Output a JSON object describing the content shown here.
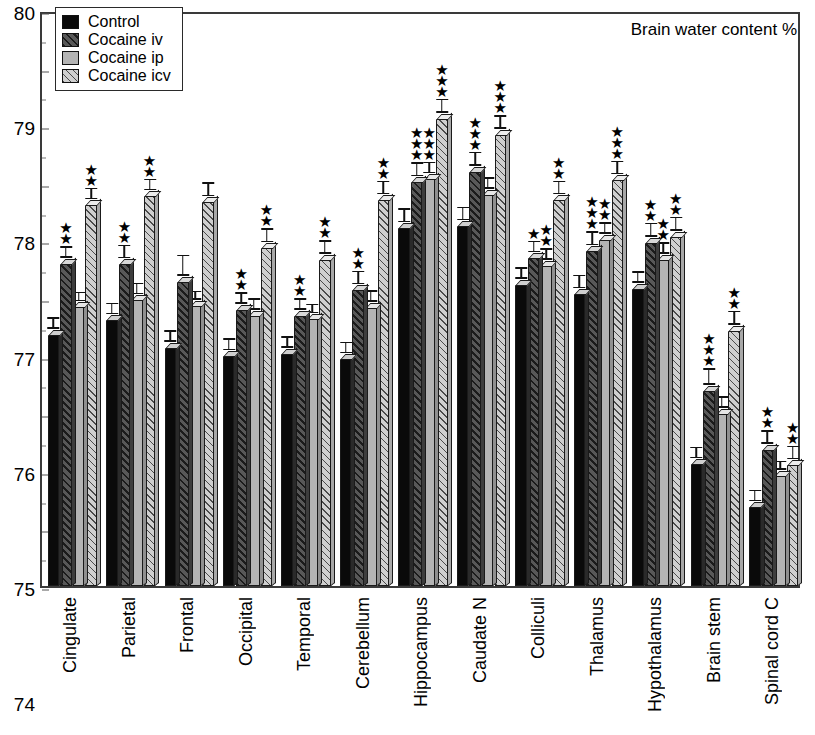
{
  "chart_data": {
    "type": "bar",
    "title": "Brain water content %",
    "xlabel": "",
    "ylabel": "",
    "ylim": [
      70,
      80
    ],
    "ytick_step": 1,
    "yminor_step": 0.5,
    "grid": false,
    "legend_position": "top-left",
    "yticks": [
      "80",
      "79",
      "78",
      "77",
      "76",
      "75",
      "74",
      "73",
      "72",
      "71",
      "70"
    ],
    "categories": [
      "Cingulate",
      "Parietal",
      "Frontal",
      "Occipital",
      "Temporal",
      "Cerebellum",
      "Hippocampus",
      "Caudate N",
      "Colliculi",
      "Thalamus",
      "Hypothalamus",
      "Brain stem",
      "Spinal cord C"
    ],
    "series": [
      {
        "name": "Control",
        "key": "control",
        "values": [
          74.45,
          74.7,
          74.22,
          74.08,
          74.12,
          74.02,
          76.3,
          76.33,
          75.32,
          75.15,
          75.25,
          72.2,
          71.45
        ],
        "errors": [
          0.1,
          0.1,
          0.1,
          0.1,
          0.1,
          0.1,
          0.12,
          0.12,
          0.1,
          0.12,
          0.1,
          0.1,
          0.1
        ],
        "sig": [
          "",
          "",
          "",
          "",
          "",
          "",
          "",
          "",
          "",
          "",
          "",
          "",
          ""
        ]
      },
      {
        "name": "Cocaine iv",
        "key": "iv",
        "values": [
          75.68,
          75.67,
          75.37,
          74.88,
          74.78,
          75.22,
          77.1,
          77.28,
          75.78,
          75.9,
          76.05,
          73.48,
          72.45
        ],
        "errors": [
          0.1,
          0.12,
          0.18,
          0.1,
          0.1,
          0.12,
          0.12,
          0.12,
          0.1,
          0.12,
          0.12,
          0.14,
          0.12
        ],
        "sig": [
          "**",
          "**",
          "",
          "**",
          "**",
          "**",
          "***",
          "***",
          "*",
          "***",
          "**",
          "***",
          "**"
        ]
      },
      {
        "name": "Cocaine ip",
        "key": "ip",
        "values": [
          74.93,
          75.05,
          74.95,
          74.78,
          74.72,
          74.92,
          77.15,
          76.88,
          75.65,
          76.1,
          75.75,
          73.08,
          72.0
        ],
        "errors": [
          0.08,
          0.1,
          0.08,
          0.1,
          0.08,
          0.1,
          0.1,
          0.1,
          0.1,
          0.1,
          0.1,
          0.1,
          0.08
        ],
        "sig": [
          "",
          "",
          "",
          "",
          "",
          "",
          "***",
          "",
          "**",
          "**",
          "**",
          "",
          ""
        ]
      },
      {
        "name": "Cocaine icv",
        "key": "icv",
        "values": [
          76.7,
          76.85,
          76.75,
          75.95,
          75.75,
          76.78,
          78.2,
          77.92,
          76.78,
          77.13,
          76.15,
          74.52,
          72.18
        ],
        "errors": [
          0.1,
          0.1,
          0.12,
          0.12,
          0.12,
          0.12,
          0.12,
          0.12,
          0.12,
          0.12,
          0.12,
          0.12,
          0.12
        ],
        "sig": [
          "**",
          "**",
          "",
          "**",
          "**",
          "**",
          "***",
          "***",
          "**",
          "***",
          "**",
          "**",
          "**"
        ]
      }
    ]
  },
  "legend": {
    "items": [
      {
        "label": "Control",
        "key": "control"
      },
      {
        "label": "Cocaine iv",
        "key": "iv"
      },
      {
        "label": "Cocaine ip",
        "key": "ip"
      },
      {
        "label": "Cocaine icv",
        "key": "icv"
      }
    ]
  },
  "colors": {
    "control": "#0a0a0a",
    "iv": "#585858",
    "ip": "#b4b4b4",
    "icv": "#cfcfcf",
    "axis": "#3a3a3a",
    "background": "#ffffff"
  }
}
